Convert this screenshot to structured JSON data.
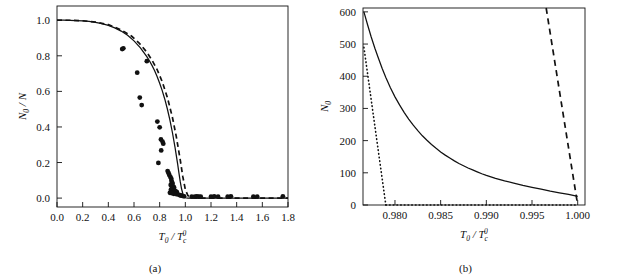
{
  "figure": {
    "background": "#ffffff",
    "ink": "#111111",
    "panels": [
      {
        "id": "a",
        "caption": "(a)"
      },
      {
        "id": "b",
        "caption": "(b)"
      }
    ]
  },
  "chart_data": [
    {
      "type": "scatter",
      "panel": "a",
      "title": "",
      "caption": "(a)",
      "xlabel": "T0/Tc0",
      "xlabel_parts": {
        "base": "T",
        "base_sub": "0",
        "divider": "/",
        "denom": "T",
        "denom_sub": "c",
        "denom_sup": "0"
      },
      "ylabel": "N0/N",
      "ylabel_parts": {
        "base": "N",
        "base_sub": "0",
        "divider": "/",
        "denom": "N"
      },
      "xlim": [
        0.0,
        1.8
      ],
      "ylim": [
        -0.05,
        1.08
      ],
      "xticks": [
        0.0,
        0.2,
        0.4,
        0.6,
        0.8,
        1.0,
        1.2,
        1.4,
        1.6,
        1.8
      ],
      "xticklabels": [
        "0.0",
        "0.2",
        "0.4",
        "0.6",
        "0.8",
        "1.0",
        "1.2",
        "1.4",
        "1.6",
        "1.8"
      ],
      "yticks": [
        0.0,
        0.2,
        0.4,
        0.6,
        0.8,
        1.0
      ],
      "yticklabels": [
        "0.0",
        "0.2",
        "0.4",
        "0.6",
        "0.8",
        "1.0"
      ],
      "grid": false,
      "legend": "none",
      "series": [
        {
          "name": "ideal-gas-theory-solid",
          "style": "solid",
          "color": "#111111",
          "points": [
            [
              0.0,
              1.0
            ],
            [
              0.05,
              1.0
            ],
            [
              0.1,
              0.999
            ],
            [
              0.15,
              0.998
            ],
            [
              0.2,
              0.996
            ],
            [
              0.25,
              0.993
            ],
            [
              0.3,
              0.988
            ],
            [
              0.35,
              0.981
            ],
            [
              0.4,
              0.971
            ],
            [
              0.45,
              0.957
            ],
            [
              0.5,
              0.939
            ],
            [
              0.55,
              0.915
            ],
            [
              0.6,
              0.884
            ],
            [
              0.65,
              0.845
            ],
            [
              0.7,
              0.795
            ],
            [
              0.72,
              0.772
            ],
            [
              0.74,
              0.746
            ],
            [
              0.76,
              0.717
            ],
            [
              0.78,
              0.684
            ],
            [
              0.8,
              0.646
            ],
            [
              0.82,
              0.604
            ],
            [
              0.84,
              0.556
            ],
            [
              0.86,
              0.501
            ],
            [
              0.88,
              0.438
            ],
            [
              0.9,
              0.366
            ],
            [
              0.92,
              0.284
            ],
            [
              0.94,
              0.192
            ],
            [
              0.95,
              0.142
            ],
            [
              0.96,
              0.094
            ],
            [
              0.97,
              0.054
            ],
            [
              0.98,
              0.026
            ],
            [
              0.99,
              0.009
            ],
            [
              1.0,
              0.002
            ],
            [
              1.02,
              0.0
            ],
            [
              1.1,
              0.0
            ],
            [
              1.4,
              0.0
            ],
            [
              1.8,
              0.0
            ]
          ]
        },
        {
          "name": "finite-size-theory-dashed",
          "style": "dashed",
          "color": "#111111",
          "points": [
            [
              0.0,
              1.0
            ],
            [
              0.1,
              1.0
            ],
            [
              0.2,
              0.997
            ],
            [
              0.3,
              0.99
            ],
            [
              0.4,
              0.975
            ],
            [
              0.5,
              0.946
            ],
            [
              0.58,
              0.911
            ],
            [
              0.64,
              0.872
            ],
            [
              0.7,
              0.82
            ],
            [
              0.74,
              0.776
            ],
            [
              0.78,
              0.723
            ],
            [
              0.82,
              0.654
            ],
            [
              0.86,
              0.566
            ],
            [
              0.9,
              0.452
            ],
            [
              0.93,
              0.344
            ],
            [
              0.96,
              0.216
            ],
            [
              0.98,
              0.122
            ],
            [
              1.0,
              0.048
            ],
            [
              1.02,
              0.014
            ],
            [
              1.05,
              0.003
            ],
            [
              1.1,
              0.0
            ],
            [
              1.4,
              0.0
            ],
            [
              1.8,
              0.0
            ]
          ]
        },
        {
          "name": "experimental-data-points",
          "style": "markers",
          "marker": "filled-circle",
          "color": "#111111",
          "points": [
            [
              0.508,
              0.838
            ],
            [
              0.517,
              0.842
            ],
            [
              0.7,
              0.77
            ],
            [
              0.625,
              0.705
            ],
            [
              0.645,
              0.565
            ],
            [
              0.66,
              0.523
            ],
            [
              0.782,
              0.43
            ],
            [
              0.8,
              0.398
            ],
            [
              0.81,
              0.33
            ],
            [
              0.822,
              0.318
            ],
            [
              0.828,
              0.306
            ],
            [
              0.812,
              0.268
            ],
            [
              0.79,
              0.198
            ],
            [
              0.862,
              0.152
            ],
            [
              0.87,
              0.14
            ],
            [
              0.876,
              0.128
            ],
            [
              0.884,
              0.118
            ],
            [
              0.89,
              0.11
            ],
            [
              0.892,
              0.098
            ],
            [
              0.896,
              0.088
            ],
            [
              0.9,
              0.082
            ],
            [
              0.886,
              0.074
            ],
            [
              0.893,
              0.068
            ],
            [
              0.905,
              0.066
            ],
            [
              0.912,
              0.06
            ],
            [
              0.898,
              0.054
            ],
            [
              0.888,
              0.048
            ],
            [
              0.906,
              0.044
            ],
            [
              0.918,
              0.042
            ],
            [
              0.926,
              0.038
            ],
            [
              0.934,
              0.034
            ],
            [
              0.88,
              0.03
            ],
            [
              0.895,
              0.028
            ],
            [
              0.91,
              0.024
            ],
            [
              0.93,
              0.022
            ],
            [
              0.946,
              0.02
            ],
            [
              0.958,
              0.016
            ],
            [
              0.968,
              0.014
            ],
            [
              0.978,
              0.012
            ],
            [
              0.99,
              0.01
            ],
            [
              1.05,
              0.008
            ],
            [
              1.075,
              0.008
            ],
            [
              1.09,
              0.01
            ],
            [
              1.105,
              0.008
            ],
            [
              1.12,
              0.008
            ],
            [
              1.2,
              0.008
            ],
            [
              1.225,
              0.01
            ],
            [
              1.255,
              0.008
            ],
            [
              1.33,
              0.008
            ],
            [
              1.355,
              0.01
            ],
            [
              1.53,
              0.008
            ],
            [
              1.56,
              0.008
            ],
            [
              1.76,
              0.01
            ]
          ]
        }
      ]
    },
    {
      "type": "line",
      "panel": "b",
      "title": "",
      "caption": "(b)",
      "xlabel": "T0/Tc0",
      "xlabel_parts": {
        "base": "T",
        "base_sub": "0",
        "divider": "/",
        "denom": "T",
        "denom_sub": "c",
        "denom_sup": "0"
      },
      "ylabel": "N0",
      "ylabel_parts": {
        "base": "N",
        "base_sub": "0"
      },
      "xlim": [
        0.9765,
        1.0008
      ],
      "ylim": [
        0,
        612
      ],
      "xticks": [
        0.98,
        0.985,
        0.99,
        0.995,
        1.0
      ],
      "xticklabels": [
        "0.980",
        "0.985",
        "0.990",
        "0.995",
        "1.000"
      ],
      "yticks": [
        0,
        100,
        200,
        300,
        400,
        500,
        600
      ],
      "yticklabels": [
        "0",
        "100",
        "200",
        "300",
        "400",
        "500",
        "600"
      ],
      "grid": false,
      "legend": "none",
      "series": [
        {
          "name": "exact-solid-curve",
          "style": "solid",
          "color": "#111111",
          "points": [
            [
              0.9766,
              600
            ],
            [
              0.977,
              560
            ],
            [
              0.9774,
              522
            ],
            [
              0.9778,
              487
            ],
            [
              0.9782,
              455
            ],
            [
              0.9786,
              424
            ],
            [
              0.979,
              396
            ],
            [
              0.9795,
              364
            ],
            [
              0.98,
              336
            ],
            [
              0.9805,
              311
            ],
            [
              0.981,
              288
            ],
            [
              0.9815,
              267
            ],
            [
              0.982,
              248
            ],
            [
              0.9825,
              231
            ],
            [
              0.983,
              215
            ],
            [
              0.9835,
              201
            ],
            [
              0.984,
              188
            ],
            [
              0.9845,
              176
            ],
            [
              0.985,
              165
            ],
            [
              0.9855,
              155
            ],
            [
              0.986,
              146
            ],
            [
              0.9865,
              137
            ],
            [
              0.987,
              129
            ],
            [
              0.9875,
              122
            ],
            [
              0.988,
              115
            ],
            [
              0.9885,
              109
            ],
            [
              0.989,
              103
            ],
            [
              0.9895,
              97
            ],
            [
              0.99,
              92
            ],
            [
              0.991,
              83
            ],
            [
              0.992,
              75
            ],
            [
              0.993,
              68
            ],
            [
              0.994,
              61
            ],
            [
              0.995,
              55
            ],
            [
              0.996,
              49
            ],
            [
              0.997,
              43
            ],
            [
              0.998,
              38
            ],
            [
              0.999,
              33
            ],
            [
              1.0,
              27
            ]
          ]
        },
        {
          "name": "asymptotic-dotted-line",
          "style": "dotted",
          "color": "#111111",
          "points": [
            [
              0.9766,
              490
            ],
            [
              0.979,
              0
            ]
          ]
        },
        {
          "name": "asymptotic-dashed-line",
          "style": "dashed",
          "color": "#111111",
          "points": [
            [
              0.99655,
              612
            ],
            [
              1.0,
              0
            ]
          ]
        },
        {
          "name": "baseline-dotted-axis",
          "style": "dotted",
          "color": "#111111",
          "points": [
            [
              0.979,
              0
            ],
            [
              1.0,
              0
            ]
          ]
        }
      ]
    }
  ]
}
